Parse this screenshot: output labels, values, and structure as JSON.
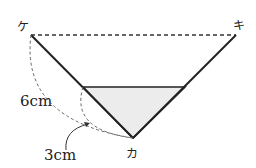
{
  "figure": {
    "points": {
      "ke": {
        "label": "ケ",
        "x": 31,
        "y": 35
      },
      "ki": {
        "label": "キ",
        "x": 236,
        "y": 35
      },
      "ka": {
        "label": "カ",
        "x": 133,
        "y": 138
      }
    },
    "shaded_triangle": {
      "top_left": [
        83,
        87
      ],
      "top_right": [
        185,
        87
      ],
      "bottom": [
        133,
        138
      ],
      "fill": "#ececec"
    },
    "measurements": {
      "long": "6cm",
      "short": "3cm"
    },
    "colors": {
      "line": "#222222",
      "dashed": "#555555",
      "shade": "#ececec"
    }
  }
}
